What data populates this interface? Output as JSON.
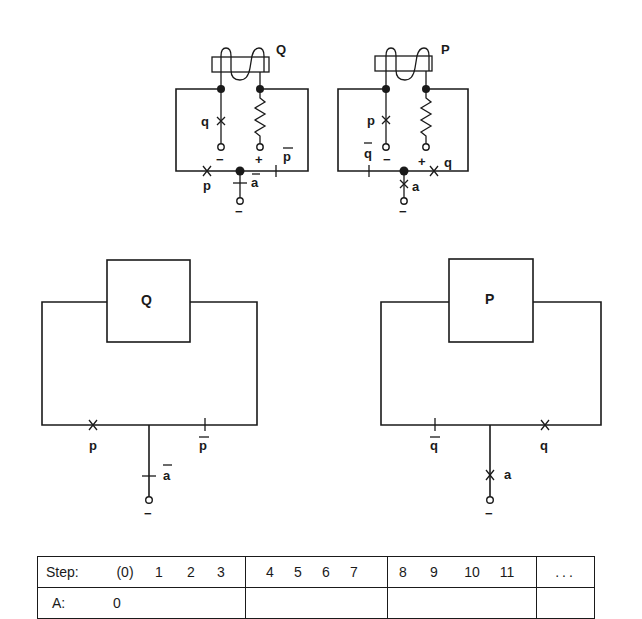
{
  "top_left": {
    "relay_label": "Q",
    "switch_q_label": "q",
    "terminal_minus": "−",
    "terminal_plus": "+",
    "contact_p_label": "p",
    "contact_pbar_label": "p",
    "contact_abar_label": "a",
    "ground_minus": "−"
  },
  "top_right": {
    "relay_label": "P",
    "switch_p_label": "p",
    "terminal_minus": "−",
    "terminal_plus": "+",
    "contact_qbar_label": "q",
    "contact_q_label": "q",
    "contact_a_label": "a",
    "ground_minus": "−"
  },
  "bottom_left": {
    "box_label": "Q",
    "contact_p_label": "p",
    "contact_pbar_label": "p",
    "contact_abar_label": "a",
    "ground_minus": "−"
  },
  "bottom_right": {
    "box_label": "P",
    "contact_qbar_label": "q",
    "contact_q_label": "q",
    "contact_a_label": "a",
    "ground_minus": "−"
  },
  "table": {
    "step_label": "Step:",
    "group1": [
      "(0)",
      "1",
      "2",
      "3"
    ],
    "group2": [
      "4",
      "5",
      "6",
      "7"
    ],
    "group3": [
      "8",
      "9",
      "10",
      "11"
    ],
    "group4": [
      "..."
    ],
    "row2_label": "A:",
    "row2_group1": [
      "0"
    ]
  }
}
